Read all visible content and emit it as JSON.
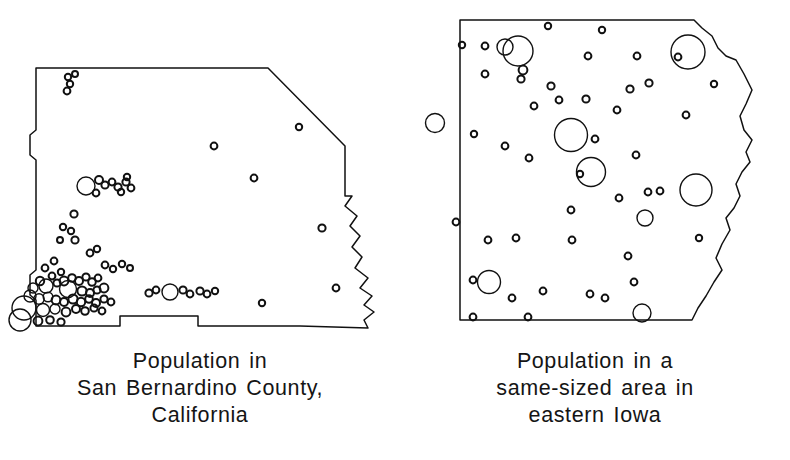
{
  "figure": {
    "type": "two-panel comparative dot-density map",
    "background_color": "#ffffff",
    "ink_color": "#111111"
  },
  "panels": [
    {
      "id": "san-bernardino",
      "caption_lines": [
        "Population in",
        "San Bernardino County,",
        "California"
      ],
      "map_name": "san-bernardino-county-outline",
      "description": "County outline with population circles concentrated in the southwest corner"
    },
    {
      "id": "eastern-iowa",
      "caption_lines": [
        "Population in a",
        "same-sized area in",
        "eastern Iowa"
      ],
      "map_name": "eastern-iowa-area-outline",
      "description": "Same-sized area outline with population circles spread evenly"
    }
  ],
  "chart_data": {
    "type": "scatter",
    "title": "",
    "subtitle": "",
    "xlabel": "",
    "ylabel": "",
    "encoding": "circle area proportional to settlement population",
    "panels": [
      {
        "name": "Population in San Bernardino County, California",
        "outline": "M 36,68 L 268,68 L 345,146 L 345,196 L 352,196 L 345,206 L 357,216 L 350,226 L 360,236 L 352,247 L 362,257 L 355,268 L 368,278 L 360,288 L 372,296 L 364,305 L 374,312 L 364,320 L 368,328 L 300,326 L 198,326 L 198,316 L 120,316 L 120,326 L 36,326 L 36,300 L 30,295 L 30,275 L 36,270 L 36,160 L 30,155 L 30,135 L 36,130 Z",
        "circles": [
          {
            "cx": 68,
            "cy": 77,
            "r": 3.2
          },
          {
            "cx": 75,
            "cy": 74,
            "r": 3.0
          },
          {
            "cx": 70,
            "cy": 84,
            "r": 3.2
          },
          {
            "cx": 67,
            "cy": 91,
            "r": 3.4
          },
          {
            "cx": 214,
            "cy": 146,
            "r": 3.4
          },
          {
            "cx": 254,
            "cy": 178,
            "r": 3.4
          },
          {
            "cx": 299,
            "cy": 127,
            "r": 3.2
          },
          {
            "cx": 86,
            "cy": 186,
            "r": 9.0
          },
          {
            "cx": 99,
            "cy": 180,
            "r": 4.0
          },
          {
            "cx": 105,
            "cy": 185,
            "r": 3.6
          },
          {
            "cx": 112,
            "cy": 182,
            "r": 3.4
          },
          {
            "cx": 118,
            "cy": 187,
            "r": 3.6
          },
          {
            "cx": 126,
            "cy": 182,
            "r": 3.6
          },
          {
            "cx": 131,
            "cy": 188,
            "r": 3.4
          },
          {
            "cx": 96,
            "cy": 193,
            "r": 3.4
          },
          {
            "cx": 74,
            "cy": 214,
            "r": 3.6
          },
          {
            "cx": 71,
            "cy": 231,
            "r": 3.2
          },
          {
            "cx": 75,
            "cy": 240,
            "r": 3.6
          },
          {
            "cx": 90,
            "cy": 253,
            "r": 3.4
          },
          {
            "cx": 97,
            "cy": 249,
            "r": 3.2
          },
          {
            "cx": 54,
            "cy": 261,
            "r": 3.4
          },
          {
            "cx": 45,
            "cy": 268,
            "r": 3.4
          },
          {
            "cx": 52,
            "cy": 276,
            "r": 3.4
          },
          {
            "cx": 61,
            "cy": 272,
            "r": 3.2
          },
          {
            "cx": 40,
            "cy": 281,
            "r": 4.2
          },
          {
            "cx": 33,
            "cy": 288,
            "r": 5.0
          },
          {
            "cx": 46,
            "cy": 286,
            "r": 7.0
          },
          {
            "cx": 57,
            "cy": 283,
            "r": 3.6
          },
          {
            "cx": 64,
            "cy": 281,
            "r": 4.4
          },
          {
            "cx": 72,
            "cy": 278,
            "r": 3.8
          },
          {
            "cx": 79,
            "cy": 281,
            "r": 4.0
          },
          {
            "cx": 86,
            "cy": 277,
            "r": 3.6
          },
          {
            "cx": 92,
            "cy": 282,
            "r": 3.8
          },
          {
            "cx": 98,
            "cy": 278,
            "r": 3.4
          },
          {
            "cx": 68,
            "cy": 289,
            "r": 8.5
          },
          {
            "cx": 82,
            "cy": 291,
            "r": 4.6
          },
          {
            "cx": 90,
            "cy": 293,
            "r": 4.0
          },
          {
            "cx": 97,
            "cy": 290,
            "r": 3.6
          },
          {
            "cx": 104,
            "cy": 288,
            "r": 4.4
          },
          {
            "cx": 30,
            "cy": 296,
            "r": 6.0
          },
          {
            "cx": 39,
            "cy": 299,
            "r": 5.2
          },
          {
            "cx": 48,
            "cy": 297,
            "r": 4.8
          },
          {
            "cx": 56,
            "cy": 300,
            "r": 4.4
          },
          {
            "cx": 64,
            "cy": 302,
            "r": 4.0
          },
          {
            "cx": 73,
            "cy": 299,
            "r": 4.6
          },
          {
            "cx": 81,
            "cy": 302,
            "r": 4.2
          },
          {
            "cx": 89,
            "cy": 299,
            "r": 3.8
          },
          {
            "cx": 96,
            "cy": 303,
            "r": 4.0
          },
          {
            "cx": 104,
            "cy": 299,
            "r": 3.6
          },
          {
            "cx": 111,
            "cy": 302,
            "r": 3.4
          },
          {
            "cx": 24,
            "cy": 308,
            "r": 12.0
          },
          {
            "cx": 43,
            "cy": 310,
            "r": 6.5
          },
          {
            "cx": 55,
            "cy": 309,
            "r": 5.0
          },
          {
            "cx": 66,
            "cy": 312,
            "r": 4.4
          },
          {
            "cx": 76,
            "cy": 309,
            "r": 4.0
          },
          {
            "cx": 85,
            "cy": 311,
            "r": 3.8
          },
          {
            "cx": 94,
            "cy": 308,
            "r": 3.6
          },
          {
            "cx": 102,
            "cy": 311,
            "r": 3.4
          },
          {
            "cx": 20,
            "cy": 320,
            "r": 11.0
          },
          {
            "cx": 38,
            "cy": 321,
            "r": 4.4
          },
          {
            "cx": 50,
            "cy": 320,
            "r": 3.8
          },
          {
            "cx": 61,
            "cy": 322,
            "r": 3.6
          },
          {
            "cx": 105,
            "cy": 265,
            "r": 3.4
          },
          {
            "cx": 113,
            "cy": 269,
            "r": 3.2
          },
          {
            "cx": 122,
            "cy": 264,
            "r": 3.2
          },
          {
            "cx": 130,
            "cy": 268,
            "r": 3.0
          },
          {
            "cx": 149,
            "cy": 293,
            "r": 3.6
          },
          {
            "cx": 156,
            "cy": 290,
            "r": 3.4
          },
          {
            "cx": 170,
            "cy": 292,
            "r": 8.0
          },
          {
            "cx": 183,
            "cy": 290,
            "r": 3.6
          },
          {
            "cx": 190,
            "cy": 294,
            "r": 3.4
          },
          {
            "cx": 200,
            "cy": 291,
            "r": 3.6
          },
          {
            "cx": 207,
            "cy": 294,
            "r": 3.4
          },
          {
            "cx": 215,
            "cy": 291,
            "r": 3.2
          },
          {
            "cx": 262,
            "cy": 303,
            "r": 3.2
          },
          {
            "cx": 322,
            "cy": 228,
            "r": 3.6
          },
          {
            "cx": 336,
            "cy": 288,
            "r": 3.4
          },
          {
            "cx": 127,
            "cy": 177,
            "r": 3.2
          },
          {
            "cx": 121,
            "cy": 192,
            "r": 3.2
          },
          {
            "cx": 60,
            "cy": 240,
            "r": 3.0
          },
          {
            "cx": 63,
            "cy": 227,
            "r": 3.2
          }
        ]
      },
      {
        "name": "Population in a same-sized area in eastern Iowa",
        "outline": "M 60,20 L 294,20 L 302,28 L 312,36 L 318,48 L 326,56 L 336,60 L 344,74 L 352,90 L 346,104 L 340,116 L 344,130 L 352,140 L 346,152 L 350,162 L 342,172 L 336,184 L 340,196 L 334,208 L 326,218 L 330,230 L 322,244 L 316,258 L 322,270 L 314,282 L 306,296 L 298,308 L 292,320 L 60,320 Z",
        "circles": [
          {
            "cx": 85,
            "cy": 46,
            "r": 3.4
          },
          {
            "cx": 148,
            "cy": 26,
            "r": 3.2
          },
          {
            "cx": 202,
            "cy": 30,
            "r": 3.2
          },
          {
            "cx": 62,
            "cy": 45,
            "r": 3.2
          },
          {
            "cx": 85,
            "cy": 74,
            "r": 3.4
          },
          {
            "cx": 188,
            "cy": 56,
            "r": 3.4
          },
          {
            "cx": 237,
            "cy": 56,
            "r": 3.4
          },
          {
            "cx": 278,
            "cy": 57,
            "r": 3.4
          },
          {
            "cx": 105,
            "cy": 47,
            "r": 8.0
          },
          {
            "cx": 118,
            "cy": 51,
            "r": 15.0
          },
          {
            "cx": 288,
            "cy": 52,
            "r": 17.0
          },
          {
            "cx": 123,
            "cy": 70,
            "r": 4.4
          },
          {
            "cx": 121,
            "cy": 79,
            "r": 3.6
          },
          {
            "cx": 151,
            "cy": 86,
            "r": 3.6
          },
          {
            "cx": 230,
            "cy": 89,
            "r": 3.6
          },
          {
            "cx": 249,
            "cy": 83,
            "r": 3.6
          },
          {
            "cx": 159,
            "cy": 100,
            "r": 3.4
          },
          {
            "cx": 186,
            "cy": 99,
            "r": 3.6
          },
          {
            "cx": 134,
            "cy": 106,
            "r": 3.4
          },
          {
            "cx": 217,
            "cy": 110,
            "r": 3.4
          },
          {
            "cx": 314,
            "cy": 84,
            "r": 3.2
          },
          {
            "cx": 35,
            "cy": 123,
            "r": 9.5
          },
          {
            "cx": 74,
            "cy": 134,
            "r": 3.2
          },
          {
            "cx": 105,
            "cy": 146,
            "r": 3.4
          },
          {
            "cx": 129,
            "cy": 158,
            "r": 3.4
          },
          {
            "cx": 171,
            "cy": 135,
            "r": 16.5
          },
          {
            "cx": 195,
            "cy": 139,
            "r": 3.4
          },
          {
            "cx": 286,
            "cy": 115,
            "r": 3.4
          },
          {
            "cx": 236,
            "cy": 155,
            "r": 3.4
          },
          {
            "cx": 191,
            "cy": 172,
            "r": 14.5
          },
          {
            "cx": 180,
            "cy": 174,
            "r": 3.2
          },
          {
            "cx": 219,
            "cy": 198,
            "r": 3.4
          },
          {
            "cx": 248,
            "cy": 192,
            "r": 3.4
          },
          {
            "cx": 260,
            "cy": 191,
            "r": 3.4
          },
          {
            "cx": 296,
            "cy": 190,
            "r": 16.0
          },
          {
            "cx": 245,
            "cy": 218,
            "r": 8.0
          },
          {
            "cx": 56,
            "cy": 222,
            "r": 3.4
          },
          {
            "cx": 88,
            "cy": 240,
            "r": 3.4
          },
          {
            "cx": 116,
            "cy": 238,
            "r": 3.4
          },
          {
            "cx": 172,
            "cy": 240,
            "r": 3.4
          },
          {
            "cx": 171,
            "cy": 210,
            "r": 3.4
          },
          {
            "cx": 228,
            "cy": 256,
            "r": 3.4
          },
          {
            "cx": 73,
            "cy": 280,
            "r": 3.4
          },
          {
            "cx": 89,
            "cy": 282,
            "r": 11.5
          },
          {
            "cx": 112,
            "cy": 298,
            "r": 3.4
          },
          {
            "cx": 143,
            "cy": 291,
            "r": 3.4
          },
          {
            "cx": 190,
            "cy": 294,
            "r": 3.4
          },
          {
            "cx": 205,
            "cy": 298,
            "r": 3.4
          },
          {
            "cx": 234,
            "cy": 282,
            "r": 3.4
          },
          {
            "cx": 73,
            "cy": 317,
            "r": 3.4
          },
          {
            "cx": 128,
            "cy": 317,
            "r": 3.4
          },
          {
            "cx": 242,
            "cy": 313,
            "r": 9.0
          },
          {
            "cx": 299,
            "cy": 238,
            "r": 3.2
          }
        ]
      }
    ]
  }
}
